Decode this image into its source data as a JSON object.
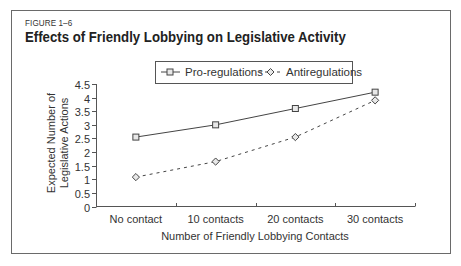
{
  "figure": {
    "label": "FIGURE 1–6",
    "title": "Effects of Friendly Lobbying on Legislative Activity"
  },
  "legend": {
    "items": [
      {
        "label": "Pro-regulations",
        "marker": "square",
        "line": "solid"
      },
      {
        "label": "Antiregulations",
        "marker": "diamond",
        "line": "dashed"
      }
    ]
  },
  "axes": {
    "xlabel": "Number of Friendly Lobbying Contacts",
    "ylabel_line1": "Expected Number of",
    "ylabel_line2": "Legislative Actions",
    "yticks": [
      "0",
      "0.5",
      "1",
      "1.5",
      "2",
      "2.5",
      "3",
      "3.5",
      "4",
      "4.5"
    ],
    "xticks": [
      "No contact",
      "10 contacts",
      "20 contacts",
      "30 contacts"
    ]
  },
  "chart_data": {
    "type": "line",
    "title": "Effects of Friendly Lobbying on Legislative Activity",
    "subtitle": "FIGURE 1–6",
    "categories": [
      "No contact",
      "10 contacts",
      "20 contacts",
      "30 contacts"
    ],
    "series": [
      {
        "name": "Pro-regulations",
        "values": [
          2.55,
          3.0,
          3.6,
          4.2
        ],
        "marker": "square",
        "line_style": "solid"
      },
      {
        "name": "Antiregulations",
        "values": [
          1.08,
          1.65,
          2.55,
          3.9
        ],
        "marker": "diamond",
        "line_style": "dashed"
      }
    ],
    "xlabel": "Number of Friendly Lobbying Contacts",
    "ylabel": "Expected Number of Legislative Actions",
    "ylim": [
      0,
      4.5
    ],
    "yticks": [
      0,
      0.5,
      1,
      1.5,
      2,
      2.5,
      3,
      3.5,
      4,
      4.5
    ],
    "grid": false,
    "legend_position": "top"
  }
}
